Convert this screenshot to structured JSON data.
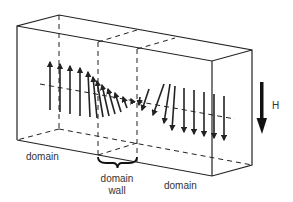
{
  "diagram": {
    "labels": {
      "left_domain": "domain",
      "domain_wall_line1": "domain",
      "domain_wall_line2": "wall",
      "right_domain": "domain",
      "field": "H"
    },
    "colors": {
      "line": "#222222",
      "text": "#333333",
      "background": "#ffffff"
    },
    "box": {
      "front_top_left": [
        17,
        26
      ],
      "front_top_right": [
        212,
        61
      ],
      "front_bottom_left": [
        17,
        140
      ],
      "front_bottom_right": [
        212,
        176
      ],
      "back_top_left": [
        59,
        15
      ],
      "back_top_right": [
        252,
        50
      ],
      "back_bottom_left": [
        59,
        129
      ],
      "back_bottom_right": [
        252,
        165
      ]
    },
    "field_arrow": {
      "direction": "down",
      "x": 262,
      "y_start": 82,
      "y_end": 132
    },
    "moments": {
      "count": 18,
      "description": "Spins point up in left domain, rotate through the wall, point down in right domain"
    }
  }
}
